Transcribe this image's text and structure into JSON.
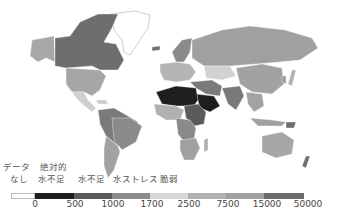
{
  "map": {
    "title": "",
    "colors": {
      "no_data": "#ffffff",
      "c0_500": "#1e1e1e",
      "c500_1000": "#555555",
      "c1000_1700": "#7a7a7a",
      "c1700_2500": "#9a9a9a",
      "c2500_7500": "#d2d2d2",
      "c7500_15000": "#b4b4b4",
      "c15000_50000": "#a2a2a2",
      "c50000_plus": "#6e6e6e"
    }
  },
  "legend": {
    "labels": [
      {
        "line1": "データ",
        "line2": "なし"
      },
      {
        "line1": "絶対的",
        "line2": "水不足"
      },
      {
        "line1": "",
        "line2": "水不足"
      },
      {
        "line1": "",
        "line2": "水ストレス"
      },
      {
        "line1": "",
        "line2": "脆弱"
      }
    ],
    "swatches": [
      {
        "color": "#ffffff",
        "width": 24
      },
      {
        "color": "#1e1e1e",
        "width": 39
      },
      {
        "color": "#5a5a5a",
        "width": 38
      },
      {
        "color": "#8a8a8a",
        "width": 38
      },
      {
        "color": "#d6d6d6",
        "width": 38
      },
      {
        "color": "#b0b0b0",
        "width": 38
      },
      {
        "color": "#a0a0a0",
        "width": 38
      },
      {
        "color": "#6c6c6c",
        "width": 40
      }
    ],
    "ticks": [
      "0",
      "500",
      "1000",
      "1700",
      "2500",
      "7500",
      "15000",
      "50000"
    ]
  }
}
